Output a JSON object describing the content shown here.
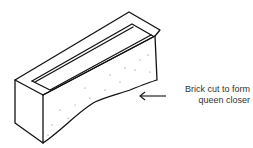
{
  "figure": {
    "annotation": {
      "line1": "Brick cut to form",
      "line2": "queen closer"
    },
    "colors": {
      "ink": "#111111",
      "background": "#ffffff"
    }
  }
}
